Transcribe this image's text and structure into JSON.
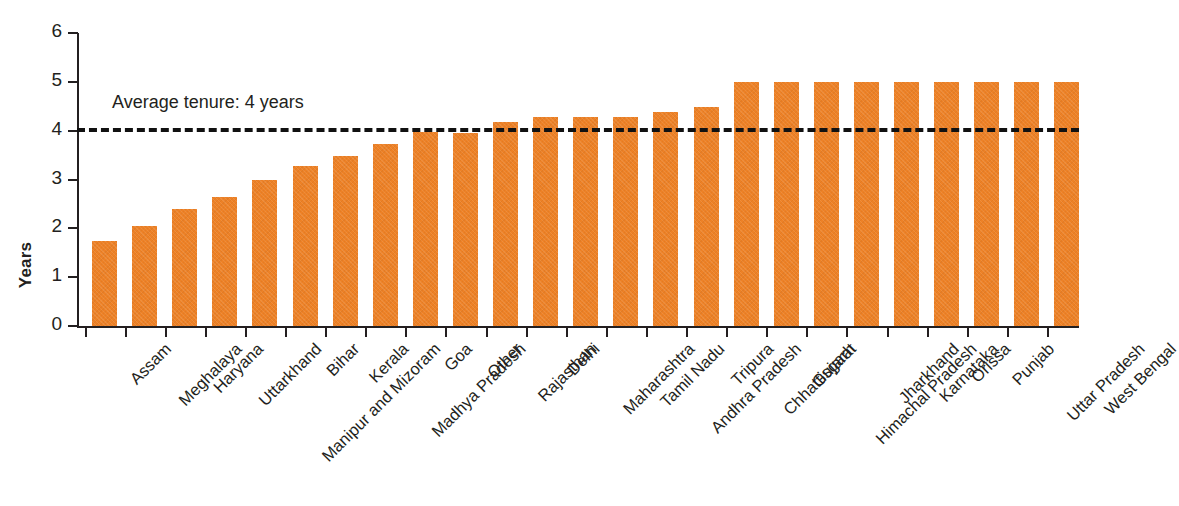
{
  "chart_data": {
    "type": "bar",
    "title": "",
    "xlabel": "",
    "ylabel": "Years",
    "ylim": [
      0,
      6
    ],
    "yticks": [
      0,
      1,
      2,
      3,
      4,
      5,
      6
    ],
    "grid": false,
    "legend": "none",
    "bar_color": "#ed8126",
    "categories": [
      "Assam",
      "Meghalaya",
      "Haryana",
      "Uttarkhand",
      "Manipur and Mizoram",
      "Bihar",
      "Kerala",
      "Madhya Pradesh",
      "Goa",
      "Other",
      "Rajasthan",
      "Delhi",
      "Maharashtra",
      "Tamil Nadu",
      "Andhra Pradesh",
      "Tripura",
      "Chhattisgarh",
      "Gujarat",
      "Himachal Pradesh",
      "Jharkhand",
      "Karnataka",
      "Orissa",
      "Punjab",
      "Uttar Pradesh",
      "West Bengal"
    ],
    "values": [
      1.74,
      2.04,
      2.39,
      2.65,
      3.0,
      3.28,
      3.49,
      3.72,
      3.97,
      3.96,
      4.17,
      4.27,
      4.27,
      4.27,
      4.38,
      4.48,
      5.0,
      5.0,
      5.0,
      5.0,
      5.0,
      5.0,
      5.0,
      5.0,
      5.0
    ],
    "annotations": [
      {
        "name": "average-tenure-line",
        "label": "Average tenure: 4 years",
        "value": 4.05,
        "style": "dashed",
        "color": "#111111"
      }
    ]
  }
}
